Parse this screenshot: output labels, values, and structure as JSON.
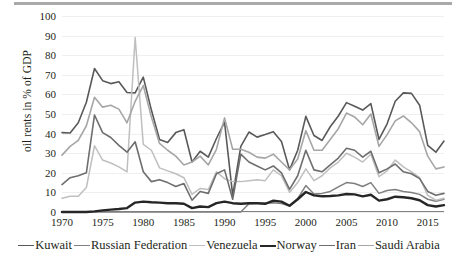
{
  "chart_data": {
    "type": "line",
    "title": "",
    "xlabel": "",
    "ylabel": "oil rents in % of GDP",
    "xlim": [
      1970,
      2017
    ],
    "ylim": [
      0,
      100
    ],
    "grid": true,
    "legend_position": "bottom",
    "ytick_labels": [
      "0",
      "10",
      "20",
      "30",
      "40",
      "50",
      "60",
      "70",
      "80",
      "90",
      "100"
    ],
    "ytick_values": [
      0,
      10,
      20,
      30,
      40,
      50,
      60,
      70,
      80,
      90,
      100
    ],
    "xtick_labels": [
      "1970",
      "1975",
      "1980",
      "1985",
      "1990",
      "1995",
      "2000",
      "2005",
      "2010",
      "2015"
    ],
    "xtick_values": [
      1970,
      1975,
      1980,
      1985,
      1990,
      1995,
      2000,
      2005,
      2010,
      2015
    ],
    "x": [
      1970,
      1971,
      1972,
      1973,
      1974,
      1975,
      1976,
      1977,
      1978,
      1979,
      1980,
      1981,
      1982,
      1983,
      1984,
      1985,
      1986,
      1987,
      1988,
      1989,
      1990,
      1991,
      1992,
      1993,
      1994,
      1995,
      1996,
      1997,
      1998,
      1999,
      2000,
      2001,
      2002,
      2003,
      2004,
      2005,
      2006,
      2007,
      2008,
      2009,
      2010,
      2011,
      2012,
      2013,
      2014,
      2015,
      2016,
      2017
    ],
    "series": [
      {
        "name": "Kuwait",
        "color": "#595959",
        "width": 1.6,
        "values": [
          40.5,
          40.3,
          45.5,
          56.0,
          73.2,
          67.0,
          65.5,
          66.5,
          61.0,
          60.8,
          68.8,
          52.0,
          37.0,
          35.5,
          40.5,
          42.0,
          25.5,
          31.0,
          28.0,
          37.5,
          45.8,
          8.5,
          33.5,
          40.8,
          38.2,
          39.5,
          41.0,
          36.0,
          21.5,
          31.5,
          48.8,
          39.0,
          36.5,
          43.5,
          49.0,
          55.8,
          54.0,
          52.0,
          55.3,
          37.0,
          45.0,
          56.5,
          60.8,
          60.5,
          54.5,
          34.0,
          30.5,
          36.2
        ]
      },
      {
        "name": "Russian Federation",
        "color": "#7f7f7f",
        "width": 1.5,
        "values": [
          0,
          0,
          0,
          0,
          0,
          0,
          0,
          0,
          0,
          0,
          0,
          0,
          0,
          0,
          0,
          0,
          0,
          0,
          0,
          0,
          0,
          0,
          0,
          4.2,
          4.5,
          4.5,
          4.7,
          4.3,
          3.0,
          6.8,
          13.5,
          9.2,
          9.5,
          10.5,
          12.8,
          15.0,
          14.5,
          13.0,
          15.0,
          9.5,
          11.0,
          11.5,
          10.5,
          10.0,
          9.0,
          6.5,
          5.5,
          6.5
        ]
      },
      {
        "name": "Venezuela",
        "color": "#bfbfbf",
        "width": 1.5,
        "values": [
          7.0,
          8.0,
          8.0,
          12.5,
          33.8,
          26.5,
          25.0,
          23.0,
          20.5,
          89.0,
          34.5,
          31.5,
          22.5,
          21.0,
          19.5,
          17.5,
          9.0,
          12.0,
          11.5,
          20.5,
          17.0,
          15.5,
          15.5,
          16.0,
          16.5,
          16.0,
          21.5,
          18.5,
          10.0,
          15.0,
          22.0,
          16.0,
          18.5,
          22.5,
          25.5,
          30.0,
          28.0,
          25.5,
          29.5,
          18.0,
          21.0,
          26.5,
          23.0,
          20.5,
          17.5,
          8.5,
          6.0,
          7.0
        ]
      },
      {
        "name": "Norway",
        "color": "#262626",
        "width": 2.4,
        "values": [
          0,
          0,
          0,
          0,
          0.3,
          0.8,
          1.2,
          1.5,
          2.0,
          4.8,
          5.3,
          5.0,
          4.8,
          4.5,
          4.5,
          4.2,
          2.0,
          2.8,
          2.5,
          4.5,
          5.3,
          4.5,
          4.2,
          4.5,
          4.5,
          4.2,
          5.8,
          5.3,
          3.2,
          6.5,
          10.2,
          8.5,
          8.0,
          8.2,
          8.5,
          9.2,
          9.0,
          8.0,
          8.8,
          5.8,
          6.5,
          7.8,
          7.5,
          7.0,
          6.0,
          3.5,
          2.8,
          3.5
        ]
      },
      {
        "name": "Iran",
        "color": "#6e6e6e",
        "width": 1.6,
        "values": [
          14.0,
          17.5,
          18.5,
          20.0,
          49.5,
          40.5,
          38.0,
          34.0,
          30.5,
          35.8,
          20.5,
          15.5,
          16.5,
          15.0,
          13.0,
          14.5,
          6.0,
          10.5,
          9.5,
          19.5,
          21.5,
          6.5,
          29.5,
          25.5,
          23.5,
          21.5,
          23.5,
          20.0,
          11.5,
          18.5,
          31.5,
          21.5,
          20.5,
          24.0,
          27.5,
          32.5,
          31.5,
          28.0,
          31.0,
          20.0,
          22.0,
          24.5,
          20.5,
          19.5,
          17.0,
          10.5,
          8.5,
          9.5
        ]
      },
      {
        "name": "Saudi Arabia",
        "color": "#a6a6a6",
        "width": 1.6,
        "values": [
          29.0,
          33.5,
          36.5,
          44.0,
          58.5,
          53.5,
          54.5,
          52.5,
          45.5,
          56.5,
          64.5,
          48.5,
          35.0,
          31.5,
          28.5,
          24.0,
          25.5,
          28.5,
          24.0,
          32.0,
          48.0,
          32.0,
          32.0,
          30.5,
          28.0,
          27.5,
          29.5,
          25.5,
          21.5,
          27.0,
          41.5,
          31.5,
          31.5,
          37.0,
          42.5,
          50.5,
          48.5,
          44.5,
          50.0,
          33.5,
          39.5,
          46.5,
          49.0,
          45.5,
          41.0,
          28.5,
          22.0,
          23.0
        ]
      }
    ]
  },
  "legend": {
    "items": [
      {
        "label": "Kuwait"
      },
      {
        "label": "Russian Federation"
      },
      {
        "label": "Venezuela"
      },
      {
        "label": "Norway"
      },
      {
        "label": "Iran"
      },
      {
        "label": "Saudi Arabia"
      }
    ]
  }
}
